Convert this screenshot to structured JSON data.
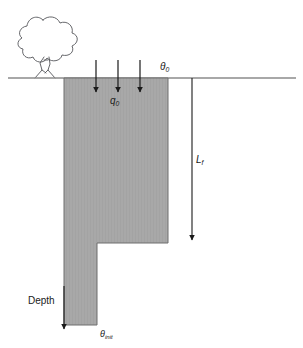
{
  "figure": {
    "background_color": "#ffffff",
    "soil_block_color": "#a8a8a8",
    "soil_block_border_color": "#6f6f6f",
    "line_color": "#808080",
    "arrow_color": "#1a1a1a",
    "text_color": "#1a1a1a"
  },
  "labels": {
    "theta_0": "θ",
    "theta_0_sub": "0",
    "q_0": "q",
    "q_0_sub": "0",
    "L_f": "L",
    "L_f_sub": "f",
    "depth": "Depth",
    "theta_init": "θ",
    "theta_init_sub": "init"
  },
  "elements": {
    "tree": "tree-outline",
    "ground_line": "ground-surface-line",
    "soil_block": "wetted-soil-block",
    "flux_arrows": [
      {
        "name": "flux-arrow-1",
        "x": 96
      },
      {
        "name": "flux-arrow-2",
        "x": 118
      },
      {
        "name": "flux-arrow-3",
        "x": 140
      }
    ],
    "wetting_front_arrow": "wetting-front-depth-arrow",
    "depth_arrow": "depth-axis-arrow"
  }
}
